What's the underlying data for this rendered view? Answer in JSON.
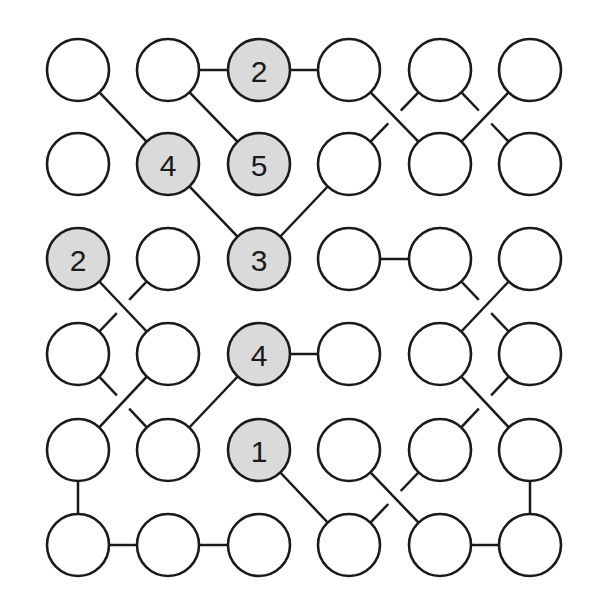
{
  "puzzle": {
    "type": "bridges-style node graph puzzle",
    "grid": {
      "rows": 6,
      "cols": 6
    },
    "col_x": [
      78,
      168,
      259,
      349,
      440,
      530
    ],
    "row_y": [
      70,
      164,
      259,
      354,
      450,
      545
    ],
    "radius": 31,
    "colors": {
      "line": "#1a1a1a",
      "empty_fill": "#ffffff",
      "clue_fill": "#dadada"
    },
    "clues": [
      {
        "row": 0,
        "col": 2,
        "value": "2"
      },
      {
        "row": 1,
        "col": 1,
        "value": "4"
      },
      {
        "row": 1,
        "col": 2,
        "value": "5"
      },
      {
        "row": 2,
        "col": 0,
        "value": "2"
      },
      {
        "row": 2,
        "col": 2,
        "value": "3"
      },
      {
        "row": 3,
        "col": 2,
        "value": "4"
      },
      {
        "row": 4,
        "col": 2,
        "value": "1"
      }
    ],
    "edges": [
      {
        "a": [
          0,
          1
        ],
        "b": [
          0,
          2
        ],
        "broken": false
      },
      {
        "a": [
          0,
          2
        ],
        "b": [
          0,
          3
        ],
        "broken": false
      },
      {
        "a": [
          0,
          0
        ],
        "b": [
          1,
          1
        ],
        "broken": false
      },
      {
        "a": [
          0,
          1
        ],
        "b": [
          1,
          2
        ],
        "broken": false
      },
      {
        "a": [
          0,
          3
        ],
        "b": [
          1,
          4
        ],
        "broken": false
      },
      {
        "a": [
          0,
          4
        ],
        "b": [
          1,
          3
        ],
        "broken": true
      },
      {
        "a": [
          0,
          5
        ],
        "b": [
          1,
          4
        ],
        "broken": false
      },
      {
        "a": [
          0,
          4
        ],
        "b": [
          1,
          5
        ],
        "broken": true
      },
      {
        "a": [
          1,
          1
        ],
        "b": [
          2,
          2
        ],
        "broken": false
      },
      {
        "a": [
          1,
          3
        ],
        "b": [
          2,
          2
        ],
        "broken": false
      },
      {
        "a": [
          2,
          3
        ],
        "b": [
          2,
          4
        ],
        "broken": false
      },
      {
        "a": [
          2,
          0
        ],
        "b": [
          3,
          1
        ],
        "broken": false
      },
      {
        "a": [
          2,
          1
        ],
        "b": [
          3,
          0
        ],
        "broken": true
      },
      {
        "a": [
          2,
          5
        ],
        "b": [
          3,
          4
        ],
        "broken": false
      },
      {
        "a": [
          2,
          4
        ],
        "b": [
          3,
          5
        ],
        "broken": true
      },
      {
        "a": [
          3,
          2
        ],
        "b": [
          3,
          3
        ],
        "broken": false
      },
      {
        "a": [
          3,
          2
        ],
        "b": [
          4,
          1
        ],
        "broken": false
      },
      {
        "a": [
          3,
          1
        ],
        "b": [
          4,
          0
        ],
        "broken": false
      },
      {
        "a": [
          3,
          0
        ],
        "b": [
          4,
          1
        ],
        "broken": true
      },
      {
        "a": [
          3,
          4
        ],
        "b": [
          4,
          5
        ],
        "broken": false
      },
      {
        "a": [
          3,
          5
        ],
        "b": [
          4,
          4
        ],
        "broken": true
      },
      {
        "a": [
          4,
          0
        ],
        "b": [
          5,
          0
        ],
        "broken": false
      },
      {
        "a": [
          5,
          0
        ],
        "b": [
          5,
          1
        ],
        "broken": false
      },
      {
        "a": [
          5,
          1
        ],
        "b": [
          5,
          2
        ],
        "broken": false
      },
      {
        "a": [
          4,
          2
        ],
        "b": [
          5,
          3
        ],
        "broken": false
      },
      {
        "a": [
          4,
          3
        ],
        "b": [
          5,
          4
        ],
        "broken": false
      },
      {
        "a": [
          4,
          4
        ],
        "b": [
          5,
          3
        ],
        "broken": true
      },
      {
        "a": [
          4,
          5
        ],
        "b": [
          5,
          5
        ],
        "broken": false
      },
      {
        "a": [
          5,
          4
        ],
        "b": [
          5,
          5
        ],
        "broken": false
      }
    ]
  }
}
